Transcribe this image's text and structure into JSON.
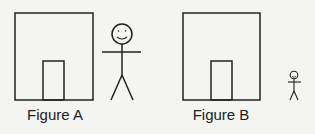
{
  "figures": [
    {
      "label": "Figure A",
      "description": "Building with door; large stick figure"
    },
    {
      "label": "Figure B",
      "description": "Building with door; small stick figure"
    }
  ],
  "colors": {
    "stroke": "#222222",
    "background": "#f4f4f2"
  }
}
